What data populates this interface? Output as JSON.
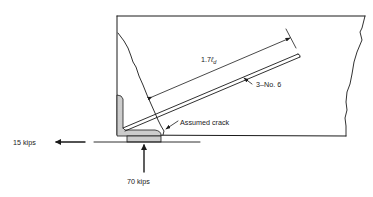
{
  "diagram": {
    "type": "structural-detail",
    "labels": {
      "development_length": "1.7",
      "development_length_symbol": "ℓ",
      "development_length_subscript": "d",
      "bars": "3–No. 6",
      "crack": "Assumed crack",
      "horizontal_force": "15 kips",
      "vertical_force": "70 kips"
    },
    "forces": [
      {
        "name": "horizontal",
        "value": 15,
        "unit": "kips",
        "direction": "left"
      },
      {
        "name": "vertical",
        "value": 70,
        "unit": "kips",
        "direction": "up"
      }
    ],
    "colors": {
      "ink": "#1a1a1a",
      "hatch_fill": "#c9c9c9",
      "background": "#ffffff"
    }
  }
}
